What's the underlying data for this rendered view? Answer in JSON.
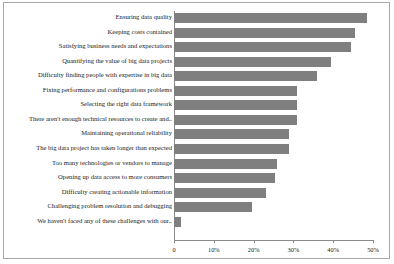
{
  "chart_data": {
    "type": "bar",
    "orientation": "horizontal",
    "title": "",
    "xlabel": "",
    "ylabel": "",
    "xlim": [
      0,
      50
    ],
    "grid": false,
    "legend": null,
    "bar_color": "#7f7f7f",
    "tick_labels": [
      "0",
      "10%",
      "20%",
      "30%",
      "40%",
      "50%"
    ],
    "tick_values": [
      0,
      10,
      20,
      30,
      40,
      50
    ],
    "categories": [
      "Ensuring data quality",
      "Keeping costs contained",
      "Satisfying business needs and expectations",
      "Quantifying the value of big data projects",
      "Difficulty finding people with expertise in big data",
      "Fixing performance and configurations problems",
      "Selecting the right data framework",
      "There aren't enough technical resources to create and..",
      "Maintaining operational reliability",
      "The big data project has taken longer than expected",
      "Too many technologies or vendors to manage",
      "Opening up data access to more consumers",
      "Difficulty creating actionable information",
      "Challenging problem resolution and debugging",
      "We haven't faced any of these challenges with our.."
    ],
    "values": [
      48.5,
      45.5,
      44.5,
      39.5,
      36.0,
      31.0,
      31.0,
      31.0,
      29.0,
      29.0,
      26.0,
      25.5,
      23.0,
      19.5,
      1.8
    ]
  }
}
